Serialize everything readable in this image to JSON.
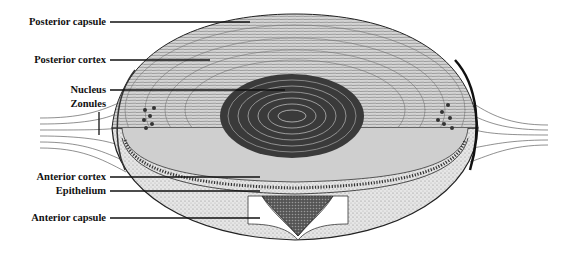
{
  "figure": {
    "labels": [
      {
        "id": "posterior-capsule",
        "text": "Posterior capsule",
        "y": 22,
        "line_end_x": 250,
        "line_end_y": 22
      },
      {
        "id": "posterior-cortex",
        "text": "Posterior cortex",
        "y": 60,
        "line_end_x": 210,
        "line_end_y": 60
      },
      {
        "id": "nucleus",
        "text": "Nucleus",
        "y": 90,
        "line_end_x": 285,
        "line_end_y": 90
      },
      {
        "id": "zonules",
        "text": "Zonules",
        "y": 104,
        "line_end_x": 0,
        "line_end_y": 0
      },
      {
        "id": "anterior-cortex",
        "text": "Anterior cortex",
        "y": 177,
        "line_end_x": 260,
        "line_end_y": 177
      },
      {
        "id": "epithelium",
        "text": "Epithelium",
        "y": 191,
        "line_end_x": 260,
        "line_end_y": 191
      },
      {
        "id": "anterior-capsule",
        "text": "Anterior capsule",
        "y": 218,
        "line_end_x": 260,
        "line_end_y": 218
      }
    ]
  }
}
